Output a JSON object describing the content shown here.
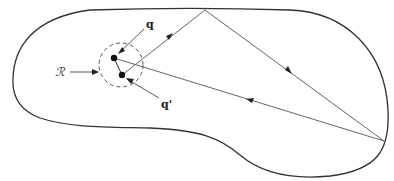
{
  "diagram": {
    "labels": {
      "q": "q",
      "q_prime": "q'",
      "region": "ℛ"
    },
    "elements": [
      "closed-boundary-curve",
      "dashed-circle-region",
      "point-q",
      "point-q-prime",
      "ray-path-with-three-segments"
    ],
    "colors": {
      "boundary": "#333333",
      "rays": "#555555",
      "points": "#111111"
    }
  }
}
